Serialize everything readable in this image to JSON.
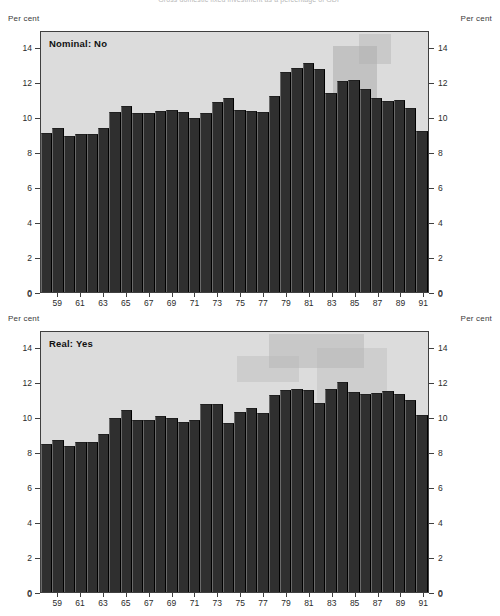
{
  "figure": {
    "title": "Gross domestic fixed investment as a percentage of GDP"
  },
  "axis_labels": {
    "unit_top_left": "Per cent",
    "unit_top_right": "Per cent",
    "unit_bottom_left": "Per cent",
    "unit_bottom_right": "Per cent"
  },
  "panels": [
    {
      "label": "Nominal: No"
    },
    {
      "label": "Real: Yes"
    }
  ],
  "chart_data": [
    {
      "type": "bar",
      "title": "Nominal: No",
      "xlabel": "",
      "ylabel": "Per cent",
      "ylim": [
        0,
        15
      ],
      "yticks": [
        0,
        2,
        4,
        6,
        8,
        10,
        12,
        14
      ],
      "grid": false,
      "legend": "none",
      "x": [
        58,
        59,
        60,
        61,
        62,
        63,
        64,
        65,
        66,
        67,
        68,
        69,
        70,
        71,
        72,
        73,
        74,
        75,
        76,
        77,
        78,
        79,
        80,
        81,
        82,
        83,
        84,
        85,
        86,
        87,
        88,
        89,
        90,
        91
      ],
      "xtick_labels": [
        "59",
        "61",
        "63",
        "65",
        "67",
        "69",
        "71",
        "73",
        "75",
        "77",
        "79",
        "81",
        "83",
        "85",
        "87",
        "89",
        "91"
      ],
      "categories": [
        "58",
        "59",
        "60",
        "61",
        "62",
        "63",
        "64",
        "65",
        "66",
        "67",
        "68",
        "69",
        "70",
        "71",
        "72",
        "73",
        "74",
        "75",
        "76",
        "77",
        "78",
        "79",
        "80",
        "81",
        "82",
        "83",
        "84",
        "85",
        "86",
        "87",
        "88",
        "89",
        "90",
        "91"
      ],
      "values": [
        9.2,
        9.45,
        9.0,
        9.1,
        9.1,
        9.45,
        10.4,
        10.75,
        10.3,
        10.3,
        10.45,
        10.5,
        10.4,
        10.05,
        10.3,
        10.95,
        11.2,
        10.5,
        10.45,
        10.4,
        11.3,
        12.7,
        12.95,
        13.2,
        12.85,
        11.5,
        12.2,
        12.25,
        11.7,
        11.2,
        11.0,
        11.1,
        10.6,
        9.3
      ]
    },
    {
      "type": "bar",
      "title": "Real: Yes",
      "xlabel": "",
      "ylabel": "Per cent",
      "ylim": [
        0,
        15
      ],
      "yticks": [
        0,
        2,
        4,
        6,
        8,
        10,
        12,
        14
      ],
      "grid": false,
      "legend": "none",
      "x": [
        58,
        59,
        60,
        61,
        62,
        63,
        64,
        65,
        66,
        67,
        68,
        69,
        70,
        71,
        72,
        73,
        74,
        75,
        76,
        77,
        78,
        79,
        80,
        81,
        82,
        83,
        84,
        85,
        86,
        87,
        88,
        89,
        90,
        91
      ],
      "xtick_labels": [
        "59",
        "61",
        "63",
        "65",
        "67",
        "69",
        "71",
        "73",
        "75",
        "77",
        "79",
        "81",
        "83",
        "85",
        "87",
        "89",
        "91"
      ],
      "categories": [
        "58",
        "59",
        "60",
        "61",
        "62",
        "63",
        "64",
        "65",
        "66",
        "67",
        "68",
        "69",
        "70",
        "71",
        "72",
        "73",
        "74",
        "75",
        "76",
        "77",
        "78",
        "79",
        "80",
        "81",
        "82",
        "83",
        "84",
        "85",
        "86",
        "87",
        "88",
        "89",
        "90",
        "91"
      ],
      "values": [
        8.55,
        8.75,
        8.45,
        8.65,
        8.65,
        9.1,
        10.05,
        10.5,
        9.9,
        9.9,
        10.15,
        10.05,
        9.8,
        9.9,
        10.85,
        10.85,
        9.75,
        10.4,
        10.6,
        10.35,
        11.35,
        11.65,
        11.7,
        11.65,
        10.9,
        11.7,
        12.1,
        11.55,
        11.4,
        11.5,
        11.6,
        11.4,
        11.1,
        10.2
      ]
    }
  ]
}
